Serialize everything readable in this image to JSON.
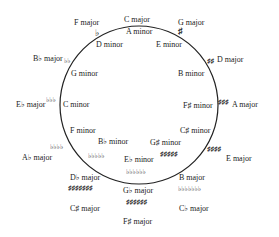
{
  "circle": {
    "cx": 139,
    "cy": 105,
    "r": 79,
    "stroke": "#222222"
  },
  "keys": [
    {
      "major": "C major",
      "minor": "A minor",
      "accidentals": ""
    },
    {
      "major": "G major",
      "minor": "E minor",
      "accidentals": "♯"
    },
    {
      "major": "D major",
      "minor": "B minor",
      "accidentals": "♯♯"
    },
    {
      "major": "A major",
      "minor": "F♯ minor",
      "accidentals": "♯♯♯"
    },
    {
      "major": "E major",
      "minor": "C♯ minor",
      "accidentals": "♯♯♯♯"
    },
    {
      "major": "B major",
      "alt_major": "C♭ major",
      "minor": "G♯ minor",
      "accidentals": "♯♯♯♯♯",
      "alt_accidentals": "♭♭♭♭♭♭♭"
    },
    {
      "major": "G♭ major",
      "alt_major": "F♯ major",
      "minor": "E♭ minor",
      "accidentals": "♭♭♭♭♭♭",
      "alt_accidentals": "♯♯♯♯♯♯"
    },
    {
      "major": "D♭ major",
      "alt_major": "C♯ major",
      "minor": "B♭ minor",
      "accidentals": "♭♭♭♭♭",
      "alt_accidentals": "♯♯♯♯♯♯♯"
    },
    {
      "major": "A♭ major",
      "minor": "F minor",
      "accidentals": "♭♭♭♭"
    },
    {
      "major": "E♭ major",
      "minor": "C minor",
      "accidentals": "♭♭♭"
    },
    {
      "major": "B♭ major",
      "minor": "G minor",
      "accidentals": "♭♭"
    },
    {
      "major": "F major",
      "minor": "D minor",
      "accidentals": "♭"
    }
  ]
}
